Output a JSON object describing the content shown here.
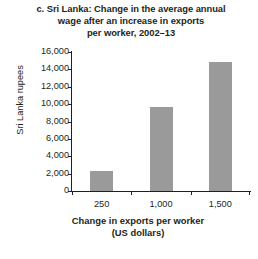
{
  "chart_data": {
    "type": "bar",
    "title": "c. Sri Lanka: Change in the average annual wage after an increase in exports per worker, 2002–13",
    "title_lines": [
      "c. Sri Lanka: Change in the average annual",
      "wage after an increase in exports",
      "per worker, 2002–13"
    ],
    "categories": [
      "250",
      "1,000",
      "1,500"
    ],
    "values": [
      2300,
      9700,
      14800
    ],
    "xlabel": "Change in exports per worker (US dollars)",
    "xlabel_lines": [
      "Change in exports per worker",
      "(US dollars)"
    ],
    "ylabel": "Sri Lanka rupees",
    "ylim": [
      0,
      16000
    ],
    "ytick_values": [
      0,
      2000,
      4000,
      6000,
      8000,
      10000,
      12000,
      14000,
      16000
    ],
    "ytick_labels": [
      "0",
      "2,000",
      "4,000",
      "6,000",
      "8,000",
      "10,000",
      "12,000",
      "14,000",
      "16,000"
    ],
    "grid": false,
    "legend": null,
    "bar_color": "#9a9a9a",
    "axis_color": "#231f20",
    "background": "#ffffff"
  }
}
